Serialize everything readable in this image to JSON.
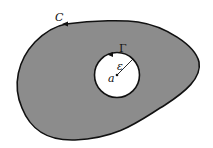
{
  "diagram": {
    "labels": {
      "outer_curve": "C",
      "inner_circle": "Γ",
      "radius": "ε",
      "center": "a"
    },
    "colors": {
      "region_fill": "#8c8c8c",
      "hole_fill": "#ffffff",
      "stroke": "#111111"
    }
  }
}
